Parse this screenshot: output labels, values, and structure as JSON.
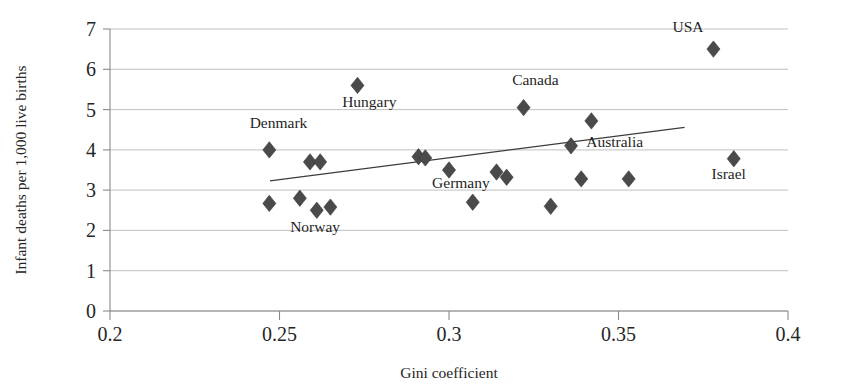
{
  "chart_data": {
    "type": "scatter",
    "title": "",
    "xlabel": "Gini coefficient",
    "ylabel": "Infant deaths per 1,000 live births",
    "xlim": [
      0.2,
      0.4
    ],
    "ylim": [
      0,
      7
    ],
    "xticks": [
      "0.2",
      "0.25",
      "0.3",
      "0.35",
      "0.4"
    ],
    "xtick_values": [
      0.2,
      0.25,
      0.3,
      0.35,
      0.4
    ],
    "yticks": [
      "0",
      "1",
      "2",
      "3",
      "4",
      "5",
      "6",
      "7"
    ],
    "ytick_values": [
      0,
      1,
      2,
      3,
      4,
      5,
      6,
      7
    ],
    "grid": "horizontal",
    "legend": "none",
    "marker": "diamond",
    "marker_color": "#4a4a4a",
    "points": [
      {
        "x": 0.247,
        "y": 4.0,
        "label": "Denmark"
      },
      {
        "x": 0.247,
        "y": 2.67,
        "label": ""
      },
      {
        "x": 0.256,
        "y": 2.8,
        "label": ""
      },
      {
        "x": 0.259,
        "y": 3.7,
        "label": ""
      },
      {
        "x": 0.262,
        "y": 3.7,
        "label": ""
      },
      {
        "x": 0.261,
        "y": 2.5,
        "label": ""
      },
      {
        "x": 0.265,
        "y": 2.58,
        "label": ""
      },
      {
        "x": 0.273,
        "y": 5.6,
        "label": "Hungary"
      },
      {
        "x": 0.291,
        "y": 3.83,
        "label": ""
      },
      {
        "x": 0.293,
        "y": 3.8,
        "label": ""
      },
      {
        "x": 0.3,
        "y": 3.5,
        "label": ""
      },
      {
        "x": 0.307,
        "y": 2.7,
        "label": ""
      },
      {
        "x": 0.314,
        "y": 3.45,
        "label": "Germany"
      },
      {
        "x": 0.317,
        "y": 3.32,
        "label": ""
      },
      {
        "x": 0.322,
        "y": 5.05,
        "label": "Canada"
      },
      {
        "x": 0.33,
        "y": 2.6,
        "label": ""
      },
      {
        "x": 0.336,
        "y": 4.1,
        "label": "Australia"
      },
      {
        "x": 0.339,
        "y": 3.28,
        "label": ""
      },
      {
        "x": 0.342,
        "y": 4.72,
        "label": ""
      },
      {
        "x": 0.353,
        "y": 3.28,
        "label": ""
      },
      {
        "x": 0.378,
        "y": 6.5,
        "label": "USA"
      },
      {
        "x": 0.384,
        "y": 3.78,
        "label": "Israel"
      }
    ],
    "trendline": {
      "x0": 0.2472,
      "y0": 3.23,
      "x1": 0.3695,
      "y1": 4.56
    },
    "annotations": [
      {
        "text": "USA",
        "x": 0.3705,
        "y": 6.92,
        "anchor": "middle"
      },
      {
        "text": "Canada",
        "x": 0.3255,
        "y": 5.62,
        "anchor": "middle"
      },
      {
        "text": "Hungary",
        "x": 0.2765,
        "y": 5.06,
        "anchor": "middle"
      },
      {
        "text": "Denmark",
        "x": 0.2497,
        "y": 4.55,
        "anchor": "middle"
      },
      {
        "text": "Australia",
        "x": 0.3405,
        "y": 4.06,
        "anchor": "start"
      },
      {
        "text": "Israel",
        "x": 0.3825,
        "y": 3.29,
        "anchor": "middle"
      },
      {
        "text": "Germany",
        "x": 0.3035,
        "y": 3.06,
        "anchor": "middle"
      },
      {
        "text": "Norway",
        "x": 0.2605,
        "y": 1.95,
        "anchor": "middle"
      }
    ]
  }
}
